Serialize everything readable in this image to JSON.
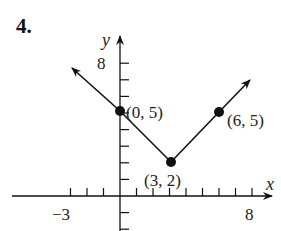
{
  "problem": {
    "number": "4."
  },
  "chart_data": {
    "type": "line",
    "title": "",
    "xlabel": "x",
    "ylabel": "y",
    "xlim": [
      -3,
      8
    ],
    "ylim": [
      -2,
      9
    ],
    "x_tick_labels": [
      "−3",
      "8"
    ],
    "y_tick_labels": [
      "8"
    ],
    "grid": false,
    "series": [
      {
        "name": "V-shaped graph",
        "x": [
          -3,
          0,
          3,
          6,
          8
        ],
        "y": [
          8,
          5,
          2,
          5,
          7
        ]
      }
    ],
    "points": [
      {
        "x": 0,
        "y": 5,
        "label": "(0, 5)"
      },
      {
        "x": 3,
        "y": 2,
        "label": "(3, 2)"
      },
      {
        "x": 6,
        "y": 5,
        "label": "(6, 5)"
      }
    ]
  }
}
